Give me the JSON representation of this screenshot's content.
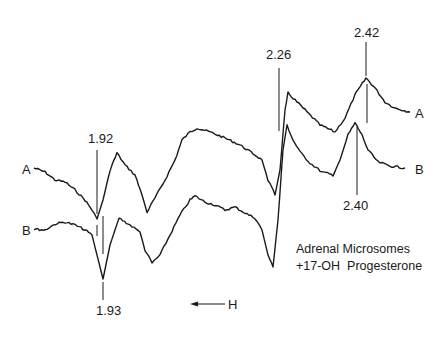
{
  "chart_data": {
    "type": "line",
    "title": "",
    "xlabel": "H",
    "x_direction": "H increases to the left (arrow points left)",
    "ylabel": "",
    "grid": false,
    "series": [
      {
        "name": "A",
        "label": "A",
        "marked_g_values": [
          1.92,
          2.26,
          2.42
        ],
        "points": [
          [
            34,
            168
          ],
          [
            45,
            172
          ],
          [
            55,
            180
          ],
          [
            65,
            182
          ],
          [
            75,
            190
          ],
          [
            85,
            200
          ],
          [
            92,
            210
          ],
          [
            97,
            219
          ],
          [
            103,
            200
          ],
          [
            110,
            170
          ],
          [
            117,
            153
          ],
          [
            125,
            165
          ],
          [
            135,
            175
          ],
          [
            142,
            195
          ],
          [
            147,
            212
          ],
          [
            155,
            198
          ],
          [
            165,
            180
          ],
          [
            175,
            160
          ],
          [
            182,
            140
          ],
          [
            190,
            132
          ],
          [
            197,
            128
          ],
          [
            210,
            132
          ],
          [
            225,
            138
          ],
          [
            240,
            145
          ],
          [
            255,
            155
          ],
          [
            262,
            160
          ],
          [
            268,
            180
          ],
          [
            275,
            195
          ],
          [
            280,
            170
          ],
          [
            285,
            110
          ],
          [
            288,
            93
          ],
          [
            295,
            100
          ],
          [
            305,
            110
          ],
          [
            320,
            125
          ],
          [
            335,
            132
          ],
          [
            345,
            118
          ],
          [
            355,
            95
          ],
          [
            366,
            78
          ],
          [
            375,
            88
          ],
          [
            385,
            102
          ],
          [
            395,
            108
          ],
          [
            410,
            112
          ]
        ]
      },
      {
        "name": "B",
        "label": "B",
        "marked_g_values": [
          1.93,
          2.4
        ],
        "points": [
          [
            34,
            229
          ],
          [
            45,
            230
          ],
          [
            55,
            224
          ],
          [
            65,
            222
          ],
          [
            75,
            225
          ],
          [
            85,
            230
          ],
          [
            92,
            235
          ],
          [
            97,
            255
          ],
          [
            103,
            279
          ],
          [
            110,
            245
          ],
          [
            119,
            218
          ],
          [
            130,
            225
          ],
          [
            140,
            232
          ],
          [
            145,
            250
          ],
          [
            152,
            263
          ],
          [
            160,
            255
          ],
          [
            170,
            235
          ],
          [
            180,
            215
          ],
          [
            190,
            200
          ],
          [
            195,
            196
          ],
          [
            205,
            202
          ],
          [
            215,
            205
          ],
          [
            225,
            210
          ],
          [
            235,
            207
          ],
          [
            245,
            213
          ],
          [
            255,
            218
          ],
          [
            262,
            230
          ],
          [
            268,
            255
          ],
          [
            273,
            267
          ],
          [
            278,
            220
          ],
          [
            283,
            150
          ],
          [
            287,
            125
          ],
          [
            293,
            140
          ],
          [
            300,
            152
          ],
          [
            310,
            163
          ],
          [
            322,
            172
          ],
          [
            333,
            175
          ],
          [
            340,
            160
          ],
          [
            348,
            135
          ],
          [
            355,
            123
          ],
          [
            362,
            135
          ],
          [
            368,
            150
          ],
          [
            378,
            162
          ],
          [
            390,
            166
          ],
          [
            405,
            168
          ]
        ]
      }
    ],
    "annotations": [
      {
        "text": "1.92",
        "series": "A",
        "x": 97
      },
      {
        "text": "1.93",
        "series": "B",
        "x": 103
      },
      {
        "text": "2.26",
        "series": "A/B",
        "x": 279
      },
      {
        "text": "2.42",
        "series": "A",
        "x": 366
      },
      {
        "text": "2.40",
        "series": "B",
        "x": 356
      }
    ],
    "legend_text": [
      "Adrenal Microsomes",
      "+17-OH Progesterone"
    ]
  },
  "labels": {
    "series_a_left": "A",
    "series_b_left": "B",
    "series_a_right": "A",
    "series_b_right": "B",
    "g192": "1.92",
    "g193": "1.93",
    "g226": "2.26",
    "g242": "2.42",
    "g240": "2.40",
    "field_arrow": "H",
    "caption_line1": "Adrenal Microsomes",
    "caption_line2": "+17-OH  Progesterone"
  }
}
